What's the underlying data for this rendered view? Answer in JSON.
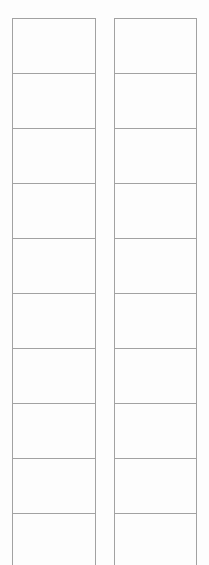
{
  "document": {
    "type": "blank-two-column-grid",
    "background_color": "#fdfdfd",
    "border_color": "#a2a2a2",
    "columns": [
      {
        "name": "left-column",
        "cells": [
          {
            "text": ""
          },
          {
            "text": ""
          },
          {
            "text": ""
          },
          {
            "text": ""
          },
          {
            "text": ""
          },
          {
            "text": ""
          },
          {
            "text": ""
          },
          {
            "text": ""
          },
          {
            "text": ""
          },
          {
            "text": ""
          }
        ]
      },
      {
        "name": "right-column",
        "cells": [
          {
            "text": ""
          },
          {
            "text": ""
          },
          {
            "text": ""
          },
          {
            "text": ""
          },
          {
            "text": ""
          },
          {
            "text": ""
          },
          {
            "text": ""
          },
          {
            "text": ""
          },
          {
            "text": ""
          },
          {
            "text": ""
          }
        ]
      }
    ]
  }
}
